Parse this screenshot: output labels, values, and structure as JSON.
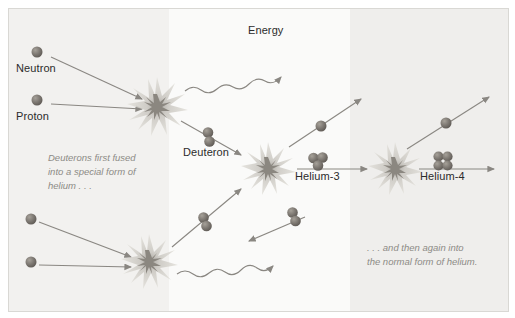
{
  "diagram": {
    "background_color": "#f7f7f6",
    "particle_color": "#7b7670",
    "arrow_color": "#8a8782",
    "burst_color": "#cfcdc7",
    "labels": {
      "neutron": "Neutron",
      "proton": "Proton",
      "energy": "Energy",
      "deuteron": "Deuteron",
      "helium3": "Helium-3",
      "helium4": "Helium-4"
    },
    "captions": {
      "left": "Deuterons first fused\ninto a special form of\nhelium . . .",
      "right": ". . . and then again into\nthe normal form of helium."
    },
    "icons": {
      "particle": "sphere-particle",
      "deuteron": "two-particle-cluster",
      "helium3": "three-particle-cluster",
      "helium4": "four-particle-cluster",
      "burst": "fusion-starburst",
      "energy": "wavy-energy-arrow",
      "arrow": "straight-arrow"
    }
  }
}
